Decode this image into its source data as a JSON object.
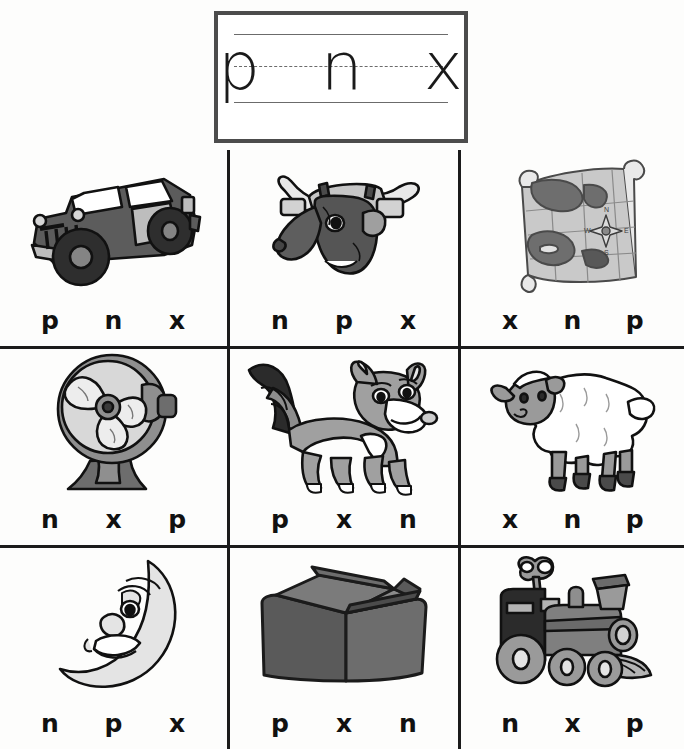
{
  "worksheet": {
    "header": {
      "letters": "p n x",
      "guide_lines": [
        "top-solid",
        "middle-dashed",
        "baseline-solid"
      ]
    },
    "grid": {
      "rows": 3,
      "columns": 3,
      "cells": [
        {
          "picture": "jeep",
          "picture_label": "jeep",
          "choices": [
            "p",
            "n",
            "x"
          ]
        },
        {
          "picture": "ox",
          "picture_label": "ox",
          "choices": [
            "n",
            "p",
            "x"
          ]
        },
        {
          "picture": "map",
          "picture_label": "map",
          "choices": [
            "x",
            "n",
            "p"
          ]
        },
        {
          "picture": "fan",
          "picture_label": "fan",
          "choices": [
            "n",
            "x",
            "p"
          ]
        },
        {
          "picture": "fox",
          "picture_label": "fox",
          "choices": [
            "p",
            "x",
            "n"
          ]
        },
        {
          "picture": "lamb",
          "picture_label": "lamb",
          "choices": [
            "x",
            "n",
            "p"
          ]
        },
        {
          "picture": "moon",
          "picture_label": "moon",
          "choices": [
            "n",
            "p",
            "x"
          ]
        },
        {
          "picture": "box",
          "picture_label": "box",
          "choices": [
            "p",
            "x",
            "n"
          ]
        },
        {
          "picture": "train",
          "picture_label": "train",
          "choices": [
            "n",
            "x",
            "p"
          ]
        }
      ]
    },
    "colors": {
      "ink": "#1b1b1b",
      "paper": "#fdfdfc",
      "dark_gray": "#4f4f4f",
      "mid_gray": "#8d8d8d",
      "light_gray": "#c8c8c8",
      "near_white": "#ededed"
    }
  }
}
